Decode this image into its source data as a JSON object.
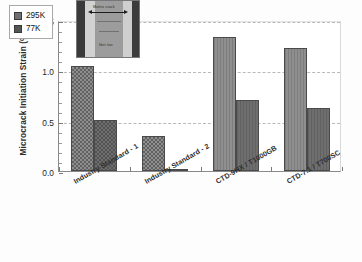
{
  "chart_data": {
    "type": "bar",
    "title": "",
    "xlabel": "",
    "ylabel": "Microcrack Initiation Strain (%)",
    "ylim": [
      0.0,
      1.5
    ],
    "yticks": [
      "0.0",
      "0.5",
      "1.0",
      "1.5"
    ],
    "ytick_values": [
      0.0,
      0.5,
      1.0,
      1.5
    ],
    "grid": true,
    "grid_axis": "y",
    "legend_position": "upper-left",
    "categories": [
      "Industry Standard - 1",
      "Industry Standard - 2",
      "CTD-9HX / T1000GB",
      "CTD-7.1 / T700SC"
    ],
    "series": [
      {
        "name": "295K",
        "color": "#8f8f8f",
        "values": [
          1.04,
          0.35,
          1.33,
          1.22
        ]
      },
      {
        "name": "77K",
        "color": "#6e6e6e",
        "values": [
          0.51,
          0.01,
          0.71,
          0.63
        ]
      }
    ]
  },
  "legend": {
    "entries": [
      {
        "label": "295K"
      },
      {
        "label": "77K"
      }
    ]
  },
  "inset": {
    "caption_top": "Matrix crack",
    "caption_bottom": "fiber tow"
  }
}
